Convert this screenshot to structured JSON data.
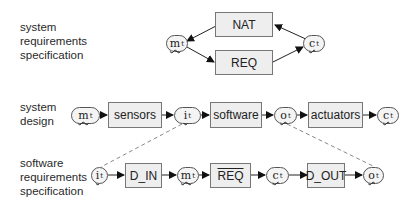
{
  "rows": {
    "srs": {
      "label": [
        "system",
        "requirements",
        "specification"
      ],
      "boxes": {
        "nat": "NAT",
        "req": "REQ"
      },
      "nodes": {
        "m": {
          "base": "m",
          "sup": "t"
        },
        "c": {
          "base": "c",
          "sup": "t"
        }
      }
    },
    "design": {
      "label": [
        "system",
        "design"
      ],
      "boxes": {
        "sensors": "sensors",
        "software": "software",
        "actuators": "actuators"
      },
      "nodes": {
        "m": {
          "base": "m",
          "sup": "t"
        },
        "i": {
          "base": "i",
          "sup": "t"
        },
        "o": {
          "base": "o",
          "sup": "t"
        },
        "c": {
          "base": "c",
          "sup": "t"
        }
      }
    },
    "swrs": {
      "label": [
        "software",
        "requirements",
        "specification"
      ],
      "boxes": {
        "d_in": "D_IN",
        "req_bar": "REQ",
        "d_out": "D_OUT"
      },
      "nodes": {
        "i": {
          "base": "i",
          "sup": "t"
        },
        "m": {
          "base": "m",
          "sup": "t"
        },
        "c": {
          "base": "c",
          "sup": "t"
        },
        "o": {
          "base": "o",
          "sup": "t"
        }
      }
    }
  },
  "colors": {
    "box_fill": "#eeeeee",
    "box_border": "#777777",
    "edge": "#222222",
    "dashed": "#888888"
  }
}
